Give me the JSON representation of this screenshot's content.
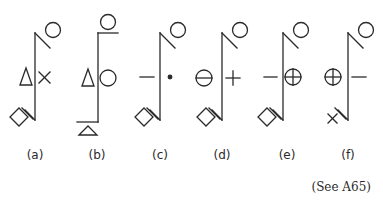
{
  "figure": {
    "ink_color": "#2a2a2a",
    "background": "#ffffff",
    "symbols": [
      {
        "id": "a",
        "label": "(a)",
        "left_sign": "triangle",
        "right_sign": "cross",
        "top": "circle-diagonal",
        "bottom": "diamond-diagonal"
      },
      {
        "id": "b",
        "label": "(b)",
        "left_sign": "triangle",
        "right_sign": "circle",
        "top": "circle-horizontal",
        "bottom": "triangle-horizontal"
      },
      {
        "id": "c",
        "label": "(c)",
        "left_sign": "dash",
        "right_sign": "dot",
        "top": "circle-diagonal",
        "bottom": "diamond-diagonal"
      },
      {
        "id": "d",
        "label": "(d)",
        "left_sign": "theta-circle",
        "right_sign": "plus",
        "top": "circle-diagonal",
        "bottom": "diamond-diagonal"
      },
      {
        "id": "e",
        "label": "(e)",
        "left_sign": "dash",
        "right_sign": "circle-plus",
        "top": "circle-diagonal",
        "bottom": "diamond-diagonal"
      },
      {
        "id": "f",
        "label": "(f)",
        "left_sign": "circle-plus",
        "right_sign": "dash",
        "top": "circle-diagonal",
        "bottom": "cross-diagonal"
      }
    ],
    "reference": "(See A65)"
  }
}
